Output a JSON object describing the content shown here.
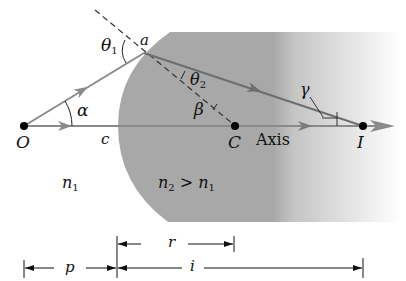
{
  "diagram": {
    "colors": {
      "medium": "#a8a8a8",
      "ray": "#8a8a8a",
      "ray_inside": "#6e6e6e",
      "ink": "#111111",
      "background": "#ffffff"
    },
    "points": {
      "object": {
        "label": "O",
        "x": 24,
        "y": 126
      },
      "center": {
        "label": "C",
        "x": 235,
        "y": 126
      },
      "image": {
        "label": "I",
        "x": 363,
        "y": 126
      },
      "incidence": {
        "label": "a",
        "x": 144,
        "y": 53
      }
    },
    "labels": {
      "theta1": "θ",
      "theta1_sub": "1",
      "theta2": "θ",
      "theta2_sub": "2",
      "alpha": "α",
      "beta": "β",
      "gamma": "γ",
      "c": "c",
      "axis": "Axis",
      "n1": "n",
      "n1_sub": "1",
      "n2": "n",
      "n2_sub": "2",
      "n2_gt": " > n",
      "n2_gt_sub": "1"
    },
    "dimensions": {
      "r": {
        "label": "r",
        "from_x": 117,
        "to_x": 234,
        "y": 244
      },
      "p": {
        "label": "p",
        "from_x": 24,
        "to_x": 117,
        "y": 268
      },
      "i": {
        "label": "i",
        "from_x": 117,
        "to_x": 363,
        "y": 268
      }
    }
  }
}
